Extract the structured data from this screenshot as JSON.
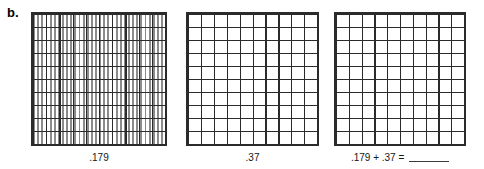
{
  "worksheet": {
    "item_letter": "b.",
    "instruction_visible": false
  },
  "colors": {
    "major_line": "#2b2b2b",
    "minor_line": "#8c8c8c",
    "border": "#2b2b2b",
    "text": "#161616",
    "background": "#ffffff"
  },
  "grids": [
    {
      "id": "grid-thousandths",
      "caption": ".179",
      "value": 0.179,
      "rows": 10,
      "columns": 10,
      "column_subdivisions": 10,
      "total_cells": 1000,
      "shaded_cells": 0,
      "shaded": false
    },
    {
      "id": "grid-hundredths-second",
      "caption": ".37",
      "value": 0.37,
      "rows": 10,
      "columns": 10,
      "column_subdivisions": 1,
      "total_cells": 100,
      "shaded_cells": 0,
      "shaded": false
    },
    {
      "id": "grid-hundredths-sum",
      "caption_parts": {
        "expression": ".179 + .37 = ",
        "answer_blank": ""
      },
      "caption": ".179 + .37 = ",
      "rows": 10,
      "columns": 10,
      "column_subdivisions": 1,
      "total_cells": 100,
      "shaded_cells": 0,
      "shaded": false
    }
  ],
  "chart_data": {
    "type": "table",
    "title": "",
    "description_visible": false,
    "categories": [
      ".179",
      ".37",
      ".179 + .37 ="
    ],
    "values": [
      0.179,
      0.37,
      null
    ]
  }
}
